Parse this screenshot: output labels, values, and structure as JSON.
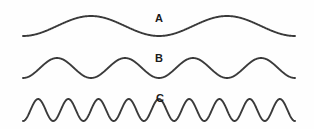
{
  "figure": {
    "background_color": "#fefefe",
    "stroke_color": "#3a3a3a",
    "label_color": "#1a1a1a",
    "width": 314,
    "height": 129
  },
  "chart_data": {
    "type": "line",
    "title": "",
    "subtitle": "",
    "xlabel": "",
    "ylabel": "",
    "grid": false,
    "legend_position": "inline-right-of-center",
    "axis_visible": false,
    "x_start_px": 23,
    "x_end_px": 295,
    "xlim": [
      23,
      295
    ],
    "ylim": [
      0,
      129
    ],
    "annotations": [
      "A",
      "B",
      "C"
    ],
    "series": [
      {
        "name": "A",
        "label": "A",
        "cycles": 2,
        "amplitude_px": 10,
        "baseline_y_px": 26,
        "peak_y_px": 16,
        "trough_y_px": 36,
        "wavelength_px": 136,
        "frequency_relative": 1,
        "label_x_px": 155,
        "label_y_px": 13
      },
      {
        "name": "B",
        "label": "B",
        "cycles": 4,
        "amplitude_px": 10,
        "baseline_y_px": 68,
        "peak_y_px": 58,
        "trough_y_px": 78,
        "wavelength_px": 68,
        "frequency_relative": 2,
        "label_x_px": 155,
        "label_y_px": 53
      },
      {
        "name": "C",
        "label": "C",
        "cycles": 9,
        "amplitude_px": 11,
        "baseline_y_px": 110,
        "peak_y_px": 99,
        "trough_y_px": 121,
        "wavelength_px": 30,
        "frequency_relative": 4.5,
        "label_x_px": 156,
        "label_y_px": 93
      }
    ]
  },
  "labels": {
    "a": "A",
    "b": "B",
    "c": "C"
  }
}
